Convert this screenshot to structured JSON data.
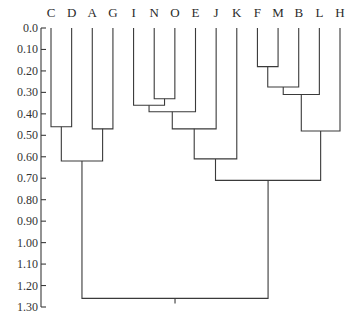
{
  "chart_data": {
    "type": "dendrogram",
    "title": "",
    "xlabel": "",
    "ylabel": "",
    "orientation": "top-down",
    "ylim": [
      0.0,
      1.3
    ],
    "y_ticks": [
      "0.0",
      "0.10",
      "0.20",
      "0.30",
      "0.40",
      "0.50",
      "0.60",
      "0.70",
      "0.80",
      "0.90",
      "1.00",
      "1.10",
      "1.20",
      "1.30"
    ],
    "leaves": [
      "C",
      "D",
      "A",
      "G",
      "I",
      "N",
      "O",
      "E",
      "J",
      "K",
      "F",
      "M",
      "B",
      "L",
      "H"
    ],
    "merges": [
      {
        "id": "FM",
        "children": [
          "F",
          "M"
        ],
        "height": 0.18
      },
      {
        "id": "FMB",
        "children": [
          "FM",
          "B"
        ],
        "height": 0.275
      },
      {
        "id": "FMBL",
        "children": [
          "FMB",
          "L"
        ],
        "height": 0.31
      },
      {
        "id": "NO",
        "children": [
          "N",
          "O"
        ],
        "height": 0.33
      },
      {
        "id": "INO",
        "children": [
          "I",
          "NO"
        ],
        "height": 0.36
      },
      {
        "id": "INOE",
        "children": [
          "INO",
          "E"
        ],
        "height": 0.39
      },
      {
        "id": "CD",
        "children": [
          "C",
          "D"
        ],
        "height": 0.46
      },
      {
        "id": "AG",
        "children": [
          "A",
          "G"
        ],
        "height": 0.47
      },
      {
        "id": "INOEJ",
        "children": [
          "INOE",
          "J"
        ],
        "height": 0.47
      },
      {
        "id": "FMBLH",
        "children": [
          "FMBL",
          "H"
        ],
        "height": 0.48
      },
      {
        "id": "INOEJK",
        "children": [
          "INOEJ",
          "K"
        ],
        "height": 0.61
      },
      {
        "id": "CDAG",
        "children": [
          "CD",
          "AG"
        ],
        "height": 0.62
      },
      {
        "id": "RIGHT",
        "children": [
          "INOEJK",
          "FMBLH"
        ],
        "height": 0.71
      },
      {
        "id": "ROOT",
        "children": [
          "CDAG",
          "RIGHT"
        ],
        "height": 1.26
      }
    ],
    "grid": false,
    "legend": null
  }
}
